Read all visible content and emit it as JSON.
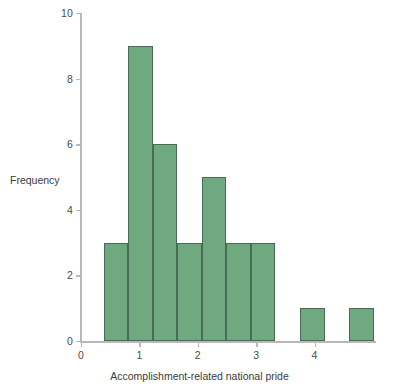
{
  "chart_data": {
    "type": "bar",
    "title": "",
    "subtitle": "",
    "xlabel": "Accomplishment-related national pride",
    "ylabel": "Frequency",
    "xlim": [
      0,
      5
    ],
    "ylim": [
      0,
      10
    ],
    "grid": false,
    "legend": null,
    "bar_style": {
      "fill": "#6fa97f",
      "edge": "#4a6b53"
    },
    "axis_color": "#b9b9b9",
    "xticks": [
      {
        "value": 0,
        "label": "0"
      },
      {
        "value": 1,
        "label": "1"
      },
      {
        "value": 2,
        "label": "2"
      },
      {
        "value": 3,
        "label": "3"
      },
      {
        "value": 4,
        "label": "4"
      }
    ],
    "yticks": [
      {
        "value": 0,
        "label": "0"
      },
      {
        "value": 2,
        "label": "2"
      },
      {
        "value": 4,
        "label": "4"
      },
      {
        "value": 6,
        "label": "6"
      },
      {
        "value": 8,
        "label": "8"
      },
      {
        "value": 10,
        "label": "10"
      }
    ],
    "bin_width": 0.42,
    "bins": [
      {
        "start": 0.39,
        "end": 0.81,
        "frequency": 3
      },
      {
        "start": 0.81,
        "end": 1.23,
        "frequency": 9
      },
      {
        "start": 1.23,
        "end": 1.65,
        "frequency": 6
      },
      {
        "start": 1.65,
        "end": 2.07,
        "frequency": 3
      },
      {
        "start": 2.07,
        "end": 2.49,
        "frequency": 5
      },
      {
        "start": 2.49,
        "end": 2.91,
        "frequency": 3
      },
      {
        "start": 2.91,
        "end": 3.33,
        "frequency": 3
      },
      {
        "start": 3.33,
        "end": 3.75,
        "frequency": 0
      },
      {
        "start": 3.75,
        "end": 4.17,
        "frequency": 1
      },
      {
        "start": 4.17,
        "end": 4.59,
        "frequency": 0
      },
      {
        "start": 4.59,
        "end": 5.01,
        "frequency": 1
      }
    ],
    "categories": [
      "0.39-0.81",
      "0.81-1.23",
      "1.23-1.65",
      "1.65-2.07",
      "2.07-2.49",
      "2.49-2.91",
      "2.91-3.33",
      "3.33-3.75",
      "3.75-4.17",
      "4.17-4.59",
      "4.59-5.01"
    ],
    "values": [
      3,
      9,
      6,
      3,
      5,
      3,
      3,
      0,
      1,
      0,
      1
    ]
  }
}
